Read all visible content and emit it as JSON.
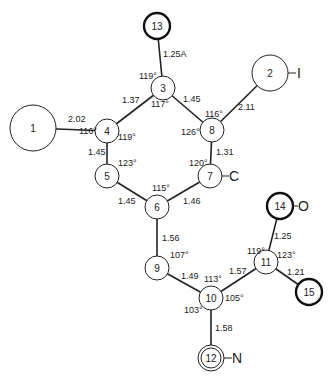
{
  "atoms": [
    {
      "id": "1",
      "x": 33,
      "y": 128,
      "r": 23,
      "style": "normal"
    },
    {
      "id": "2",
      "x": 270,
      "y": 73,
      "r": 18,
      "style": "normal",
      "element": "I"
    },
    {
      "id": "3",
      "x": 163,
      "y": 88,
      "r": 12,
      "style": "normal"
    },
    {
      "id": "4",
      "x": 107,
      "y": 131,
      "r": 12,
      "style": "normal"
    },
    {
      "id": "5",
      "x": 107,
      "y": 176,
      "r": 12,
      "style": "normal"
    },
    {
      "id": "6",
      "x": 157,
      "y": 207,
      "r": 12,
      "style": "normal"
    },
    {
      "id": "7",
      "x": 210,
      "y": 176,
      "r": 12,
      "style": "normal",
      "element": "C"
    },
    {
      "id": "8",
      "x": 212,
      "y": 130,
      "r": 12,
      "style": "normal"
    },
    {
      "id": "9",
      "x": 157,
      "y": 268,
      "r": 12,
      "style": "normal"
    },
    {
      "id": "10",
      "x": 211,
      "y": 298,
      "r": 12,
      "style": "normal"
    },
    {
      "id": "11",
      "x": 266,
      "y": 262,
      "r": 12,
      "style": "normal"
    },
    {
      "id": "12",
      "x": 211,
      "y": 358,
      "r": 12,
      "style": "double",
      "element": "N"
    },
    {
      "id": "13",
      "x": 157,
      "y": 26,
      "r": 13,
      "style": "thick"
    },
    {
      "id": "14",
      "x": 280,
      "y": 206,
      "r": 13,
      "style": "thick",
      "element": "O"
    },
    {
      "id": "15",
      "x": 309,
      "y": 292,
      "r": 13,
      "style": "thick"
    }
  ],
  "bonds": [
    {
      "from": "1",
      "to": "4",
      "length": "2.02"
    },
    {
      "from": "4",
      "to": "3",
      "length": "1.37"
    },
    {
      "from": "3",
      "to": "13",
      "length": "1.25A"
    },
    {
      "from": "3",
      "to": "8",
      "length": "1.45"
    },
    {
      "from": "8",
      "to": "2",
      "length": "2.11"
    },
    {
      "from": "4",
      "to": "5",
      "length": "1.45"
    },
    {
      "from": "8",
      "to": "7",
      "length": "1.31"
    },
    {
      "from": "5",
      "to": "6",
      "length": "1.45"
    },
    {
      "from": "6",
      "to": "7",
      "length": "1.46"
    },
    {
      "from": "6",
      "to": "9",
      "length": "1.56"
    },
    {
      "from": "9",
      "to": "10",
      "length": "1.49"
    },
    {
      "from": "10",
      "to": "11",
      "length": "1.57"
    },
    {
      "from": "11",
      "to": "14",
      "length": "1.25"
    },
    {
      "from": "11",
      "to": "15",
      "length": "1.21"
    },
    {
      "from": "10",
      "to": "12",
      "length": "1.58"
    }
  ],
  "angles": [
    {
      "atom": "3",
      "value": "119°",
      "pos": "upper-left"
    },
    {
      "atom": "3",
      "value": "117°",
      "pos": "below"
    },
    {
      "atom": "4",
      "value": "116°",
      "pos": "left"
    },
    {
      "atom": "4",
      "value": "119°",
      "pos": "lower-right"
    },
    {
      "atom": "8",
      "value": "116°",
      "pos": "upper"
    },
    {
      "atom": "8",
      "value": "126°",
      "pos": "left"
    },
    {
      "atom": "5",
      "value": "123°",
      "pos": "upper-right"
    },
    {
      "atom": "7",
      "value": "120°",
      "pos": "upper-left"
    },
    {
      "atom": "6",
      "value": "115°",
      "pos": "upper"
    },
    {
      "atom": "9",
      "value": "107°",
      "pos": "upper-right"
    },
    {
      "atom": "10",
      "value": "113°",
      "pos": "upper"
    },
    {
      "atom": "10",
      "value": "105°",
      "pos": "right"
    },
    {
      "atom": "10",
      "value": "103°",
      "pos": "lower-left"
    },
    {
      "atom": "11",
      "value": "119°",
      "pos": "upper-left"
    },
    {
      "atom": "11",
      "value": "123°",
      "pos": "upper-right"
    }
  ],
  "element_labels": {
    "atom2": "I",
    "atom7": "C",
    "atom12": "N",
    "atom14": "O"
  }
}
